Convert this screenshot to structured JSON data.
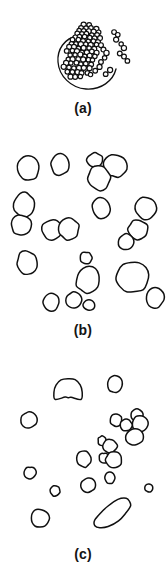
{
  "figure": {
    "background_color": "#ffffff",
    "ink_color": "#101010",
    "panel_count": 3
  },
  "panels": [
    {
      "id": "a",
      "label": "(a)",
      "content_type": "dense-aggregated-particles",
      "particle_count": 96,
      "particle_style": "small circle outlines",
      "has_enclosing_arc": true,
      "density": "high"
    },
    {
      "id": "b",
      "label": "(b)",
      "content_type": "dispersed-large-blobs",
      "particle_count": 27,
      "particle_style": "large irregular ovoid outlines",
      "has_enclosing_arc": false,
      "density": "medium"
    },
    {
      "id": "c",
      "label": "(c)",
      "content_type": "sparse-mixed-blobs",
      "particle_count": 25,
      "particle_style": "small to medium irregular outlines with one elongated rod and one notched blob",
      "has_enclosing_arc": false,
      "density": "low"
    }
  ],
  "chart_data": {
    "type": "scatter",
    "title": "",
    "xlabel": "",
    "ylabel": "",
    "grid": false,
    "legend": false,
    "panels": [
      {
        "panel": "a",
        "label": "(a)",
        "marker": "circle-outline",
        "xlim": [
          0,
          166
        ],
        "ylim": [
          0,
          104
        ],
        "enclosing_arc": {
          "cx": 87,
          "cy": 62,
          "r": 27,
          "start_deg": 95,
          "end_deg": 385,
          "note": "open circular outline around lower aggregate"
        },
        "points": [
          {
            "x": 84,
            "y": 25,
            "r": 2.4
          },
          {
            "x": 89,
            "y": 25,
            "r": 2.4
          },
          {
            "x": 81,
            "y": 28,
            "r": 2.4
          },
          {
            "x": 86,
            "y": 28,
            "r": 2.4
          },
          {
            "x": 91,
            "y": 28,
            "r": 2.4
          },
          {
            "x": 96,
            "y": 29,
            "r": 2.4
          },
          {
            "x": 79,
            "y": 31,
            "r": 2.4
          },
          {
            "x": 84,
            "y": 31,
            "r": 2.4
          },
          {
            "x": 89,
            "y": 31,
            "r": 2.4
          },
          {
            "x": 94,
            "y": 32,
            "r": 2.4
          },
          {
            "x": 99,
            "y": 32,
            "r": 2.4
          },
          {
            "x": 77,
            "y": 34,
            "r": 2.4
          },
          {
            "x": 82,
            "y": 34,
            "r": 2.4
          },
          {
            "x": 87,
            "y": 34,
            "r": 2.4
          },
          {
            "x": 92,
            "y": 35,
            "r": 2.4
          },
          {
            "x": 97,
            "y": 35,
            "r": 2.4
          },
          {
            "x": 75,
            "y": 37,
            "r": 2.4
          },
          {
            "x": 80,
            "y": 37,
            "r": 2.4
          },
          {
            "x": 85,
            "y": 37,
            "r": 2.4
          },
          {
            "x": 90,
            "y": 38,
            "r": 2.4
          },
          {
            "x": 95,
            "y": 38,
            "r": 2.4
          },
          {
            "x": 100,
            "y": 38,
            "r": 2.4
          },
          {
            "x": 73,
            "y": 40,
            "r": 2.4
          },
          {
            "x": 78,
            "y": 40,
            "r": 2.4
          },
          {
            "x": 83,
            "y": 41,
            "r": 2.4
          },
          {
            "x": 88,
            "y": 41,
            "r": 2.4
          },
          {
            "x": 93,
            "y": 41,
            "r": 2.4
          },
          {
            "x": 98,
            "y": 42,
            "r": 2.4
          },
          {
            "x": 71,
            "y": 44,
            "r": 2.4
          },
          {
            "x": 76,
            "y": 44,
            "r": 2.4
          },
          {
            "x": 81,
            "y": 44,
            "r": 2.4
          },
          {
            "x": 86,
            "y": 44,
            "r": 2.4
          },
          {
            "x": 91,
            "y": 45,
            "r": 2.4
          },
          {
            "x": 96,
            "y": 45,
            "r": 2.4
          },
          {
            "x": 101,
            "y": 45,
            "r": 2.4
          },
          {
            "x": 69,
            "y": 47,
            "r": 2.4
          },
          {
            "x": 74,
            "y": 47,
            "r": 2.4
          },
          {
            "x": 79,
            "y": 48,
            "r": 2.4
          },
          {
            "x": 84,
            "y": 48,
            "r": 2.4
          },
          {
            "x": 89,
            "y": 48,
            "r": 2.4
          },
          {
            "x": 94,
            "y": 49,
            "r": 2.4
          },
          {
            "x": 67,
            "y": 51,
            "r": 2.4
          },
          {
            "x": 72,
            "y": 51,
            "r": 2.4
          },
          {
            "x": 77,
            "y": 51,
            "r": 2.4
          },
          {
            "x": 82,
            "y": 52,
            "r": 2.4
          },
          {
            "x": 87,
            "y": 52,
            "r": 2.4
          },
          {
            "x": 92,
            "y": 52,
            "r": 2.4
          },
          {
            "x": 97,
            "y": 53,
            "r": 2.4
          },
          {
            "x": 70,
            "y": 55,
            "r": 2.4
          },
          {
            "x": 75,
            "y": 55,
            "r": 2.4
          },
          {
            "x": 80,
            "y": 55,
            "r": 2.4
          },
          {
            "x": 85,
            "y": 56,
            "r": 2.4
          },
          {
            "x": 90,
            "y": 56,
            "r": 2.4
          },
          {
            "x": 95,
            "y": 56,
            "r": 2.4
          },
          {
            "x": 68,
            "y": 59,
            "r": 2.4
          },
          {
            "x": 73,
            "y": 59,
            "r": 2.4
          },
          {
            "x": 78,
            "y": 59,
            "r": 2.4
          },
          {
            "x": 83,
            "y": 60,
            "r": 2.4
          },
          {
            "x": 88,
            "y": 60,
            "r": 2.4
          },
          {
            "x": 93,
            "y": 60,
            "r": 2.4
          },
          {
            "x": 66,
            "y": 63,
            "r": 2.4
          },
          {
            "x": 71,
            "y": 63,
            "r": 2.4
          },
          {
            "x": 76,
            "y": 63,
            "r": 2.4
          },
          {
            "x": 81,
            "y": 64,
            "r": 2.4
          },
          {
            "x": 86,
            "y": 64,
            "r": 2.4
          },
          {
            "x": 91,
            "y": 64,
            "r": 2.4
          },
          {
            "x": 64,
            "y": 67,
            "r": 2.4
          },
          {
            "x": 69,
            "y": 67,
            "r": 2.4
          },
          {
            "x": 74,
            "y": 68,
            "r": 2.4
          },
          {
            "x": 79,
            "y": 68,
            "r": 2.4
          },
          {
            "x": 84,
            "y": 68,
            "r": 2.4
          },
          {
            "x": 89,
            "y": 68,
            "r": 2.4
          },
          {
            "x": 67,
            "y": 72,
            "r": 2.4
          },
          {
            "x": 72,
            "y": 72,
            "r": 2.4
          },
          {
            "x": 77,
            "y": 72,
            "r": 2.4
          },
          {
            "x": 82,
            "y": 73,
            "r": 2.4
          },
          {
            "x": 87,
            "y": 73,
            "r": 2.4
          },
          {
            "x": 70,
            "y": 77,
            "r": 2.4
          },
          {
            "x": 75,
            "y": 77,
            "r": 2.4
          },
          {
            "x": 80,
            "y": 77,
            "r": 2.4
          },
          {
            "x": 103,
            "y": 49,
            "r": 2.4
          },
          {
            "x": 106,
            "y": 53,
            "r": 2.4
          },
          {
            "x": 105,
            "y": 58,
            "r": 2.4
          },
          {
            "x": 101,
            "y": 62,
            "r": 2.4
          },
          {
            "x": 99,
            "y": 67,
            "r": 2.4
          },
          {
            "x": 95,
            "y": 71,
            "r": 2.4
          },
          {
            "x": 91,
            "y": 75,
            "r": 2.4
          },
          {
            "x": 114,
            "y": 32,
            "r": 2.4
          },
          {
            "x": 118,
            "y": 35,
            "r": 2.4
          },
          {
            "x": 116,
            "y": 40,
            "r": 2.4
          },
          {
            "x": 121,
            "y": 44,
            "r": 2.4
          },
          {
            "x": 124,
            "y": 48,
            "r": 2.4
          },
          {
            "x": 120,
            "y": 53,
            "r": 2.4
          },
          {
            "x": 124,
            "y": 57,
            "r": 2.4
          },
          {
            "x": 127,
            "y": 61,
            "r": 2.4
          },
          {
            "x": 110,
            "y": 70,
            "r": 2.4
          },
          {
            "x": 106,
            "y": 74,
            "r": 2.4
          }
        ]
      },
      {
        "panel": "b",
        "label": "(b)",
        "marker": "blob-outline",
        "xlim": [
          0,
          166
        ],
        "ylim": [
          0,
          172
        ],
        "points": [
          {
            "x": 28,
            "y": 18,
            "rx": 11,
            "ry": 12,
            "rot": -10
          },
          {
            "x": 60,
            "y": 14,
            "rx": 9,
            "ry": 11,
            "rot": 5
          },
          {
            "x": 95,
            "y": 10,
            "rx": 8,
            "ry": 7,
            "rot": 0
          },
          {
            "x": 115,
            "y": 16,
            "rx": 12,
            "ry": 11,
            "rot": 15
          },
          {
            "x": 99,
            "y": 28,
            "rx": 11,
            "ry": 12,
            "rot": -5
          },
          {
            "x": 24,
            "y": 55,
            "rx": 10,
            "ry": 12,
            "rot": 8
          },
          {
            "x": 21,
            "y": 75,
            "rx": 10,
            "ry": 10,
            "rot": -20
          },
          {
            "x": 52,
            "y": 80,
            "rx": 10,
            "ry": 10,
            "rot": 0
          },
          {
            "x": 69,
            "y": 79,
            "rx": 10,
            "ry": 11,
            "rot": 10
          },
          {
            "x": 101,
            "y": 58,
            "rx": 9,
            "ry": 10,
            "rot": -15
          },
          {
            "x": 146,
            "y": 58,
            "rx": 11,
            "ry": 11,
            "rot": 12
          },
          {
            "x": 138,
            "y": 80,
            "rx": 10,
            "ry": 10,
            "rot": -25
          },
          {
            "x": 126,
            "y": 92,
            "rx": 8,
            "ry": 8,
            "rot": 0
          },
          {
            "x": 27,
            "y": 113,
            "rx": 10,
            "ry": 12,
            "rot": -8
          },
          {
            "x": 86,
            "y": 108,
            "rx": 6,
            "ry": 6,
            "rot": 0
          },
          {
            "x": 88,
            "y": 130,
            "rx": 12,
            "ry": 13,
            "rot": 5
          },
          {
            "x": 133,
            "y": 127,
            "rx": 16,
            "ry": 15,
            "rot": -8
          },
          {
            "x": 155,
            "y": 148,
            "rx": 9,
            "ry": 10,
            "rot": 10
          },
          {
            "x": 51,
            "y": 152,
            "rx": 8,
            "ry": 9,
            "rot": 0
          },
          {
            "x": 74,
            "y": 150,
            "rx": 8,
            "ry": 8,
            "rot": -5
          },
          {
            "x": 89,
            "y": 155,
            "rx": 6,
            "ry": 5,
            "rot": 0
          }
        ]
      },
      {
        "panel": "c",
        "label": "(c)",
        "marker": "blob-outline",
        "xlim": [
          0,
          166
        ],
        "ylim": [
          0,
          178
        ],
        "points": [
          {
            "x": 68,
            "y": 24,
            "rx": 14,
            "ry": 14,
            "rot": 0,
            "shape": "notched"
          },
          {
            "x": 115,
            "y": 16,
            "rx": 7,
            "ry": 9,
            "rot": 15
          },
          {
            "x": 29,
            "y": 52,
            "rx": 8,
            "ry": 8,
            "rot": 0
          },
          {
            "x": 116,
            "y": 52,
            "rx": 6,
            "ry": 6,
            "rot": 0
          },
          {
            "x": 126,
            "y": 57,
            "rx": 6,
            "ry": 6,
            "rot": 0
          },
          {
            "x": 137,
            "y": 47,
            "rx": 6,
            "ry": 6,
            "rot": 0
          },
          {
            "x": 140,
            "y": 56,
            "rx": 8,
            "ry": 8,
            "rot": 0
          },
          {
            "x": 135,
            "y": 69,
            "rx": 9,
            "ry": 8,
            "rot": 0
          },
          {
            "x": 102,
            "y": 73,
            "rx": 4,
            "ry": 5,
            "rot": 0
          },
          {
            "x": 110,
            "y": 78,
            "rx": 7,
            "ry": 7,
            "rot": 0
          },
          {
            "x": 104,
            "y": 90,
            "rx": 5,
            "ry": 5,
            "rot": 0
          },
          {
            "x": 114,
            "y": 92,
            "rx": 8,
            "ry": 8,
            "rot": 0
          },
          {
            "x": 84,
            "y": 91,
            "rx": 7,
            "ry": 8,
            "rot": -10
          },
          {
            "x": 110,
            "y": 110,
            "rx": 5,
            "ry": 6,
            "rot": 0
          },
          {
            "x": 30,
            "y": 105,
            "rx": 6,
            "ry": 6,
            "rot": 0
          },
          {
            "x": 88,
            "y": 117,
            "rx": 7,
            "ry": 7,
            "rot": 0
          },
          {
            "x": 55,
            "y": 123,
            "rx": 5,
            "ry": 5,
            "rot": -15
          },
          {
            "x": 149,
            "y": 120,
            "rx": 4,
            "ry": 4,
            "rot": 0
          },
          {
            "x": 40,
            "y": 150,
            "rx": 9,
            "ry": 9,
            "rot": 0
          },
          {
            "x": 113,
            "y": 145,
            "rx": 22,
            "ry": 9,
            "rot": -35,
            "shape": "rod"
          }
        ]
      }
    ]
  }
}
